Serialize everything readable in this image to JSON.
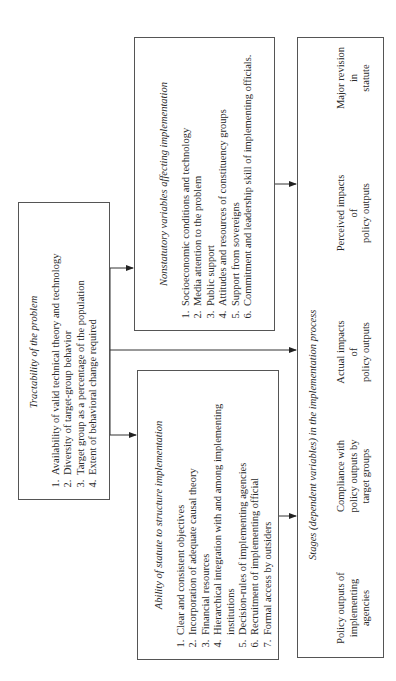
{
  "tractability": {
    "title": "Tractability of the problem",
    "items": [
      "Availability of valid technical theory and technology",
      "Diversity of target-group behavior",
      "Target group as a percentage of the population",
      "Extent of behavioral change required"
    ]
  },
  "nonstatutory": {
    "title": "Nonstatutory variables affecting implementation",
    "items": [
      "Socioeconomic conditions and technology",
      "Media attention to the problem",
      "Public support",
      "Attitudes and resources of constituency groups",
      "Support from sovereigns",
      "Commitment and leadership skill of implementing officials."
    ]
  },
  "ability": {
    "title": "Ability of statute to structure implementation",
    "items": [
      "Clear and consistent objectives",
      "Incorporation of adequate causal theory",
      "Financial resources",
      "Hierarchical integration with and among implementing institutions",
      "Decision-rules of implementing agencies",
      "Recruitment of implementing official",
      "Formal access by outsiders"
    ]
  },
  "stages": {
    "title": "Stages (dependent variables) in the implementation process",
    "steps": [
      {
        "line1": "Policy outputs of",
        "line2": "implementing",
        "line3": "agencies"
      },
      {
        "line1": "Compliance with",
        "line2": "policy outputs by",
        "line3": "target groups"
      },
      {
        "line1": "Actual impacts",
        "line2": "of",
        "line3": "policy outputs"
      },
      {
        "line1": "Perceived impacts",
        "line2": "of",
        "line3": "policy outputs"
      },
      {
        "line1": "Major revision",
        "line2": "in",
        "line3": "statute"
      }
    ]
  },
  "colors": {
    "line": "#333333",
    "border": "#555555",
    "text": "#2a2a2a"
  }
}
